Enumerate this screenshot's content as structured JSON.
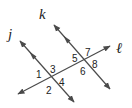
{
  "diagram": {
    "type": "parallel-lines-transversal",
    "lines": [
      {
        "name": "j",
        "role": "parallel line",
        "x1": 20,
        "y1": 41,
        "x2": 74,
        "y2": 102
      },
      {
        "name": "k",
        "role": "parallel line",
        "x1": 54,
        "y1": 25,
        "x2": 110,
        "y2": 89
      },
      {
        "name": "ℓ",
        "role": "transversal",
        "x1": 18,
        "y1": 94,
        "x2": 110,
        "y2": 46
      }
    ],
    "line_labels": {
      "j": "j",
      "k": "k",
      "l": "ℓ"
    },
    "angles": {
      "a1": "1",
      "a2": "2",
      "a3": "3",
      "a4": "4",
      "a5": "5",
      "a6": "6",
      "a7": "7",
      "a8": "8"
    },
    "parallel_marker": "single arrowhead on j and k",
    "colors": {
      "line": "#4a4a4a",
      "text": "#222222",
      "background": "#ffffff"
    }
  }
}
